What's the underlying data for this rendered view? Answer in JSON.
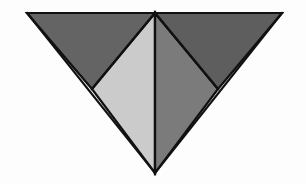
{
  "figure": {
    "name": "subdivided-inverted-triangle",
    "canvas": {
      "width": 306,
      "height": 184,
      "background_color": "#fdfdfd"
    },
    "stroke": {
      "color": "#111111",
      "width": 2.2
    },
    "vertices": {
      "top_left": [
        27,
        13
      ],
      "top_right": [
        282,
        13
      ],
      "top_center": [
        155,
        13
      ],
      "bottom_center": [
        155,
        173
      ],
      "left_mid": [
        92,
        89
      ],
      "right_mid": [
        218,
        89
      ]
    },
    "regions": [
      {
        "id": "left-outer-triangle",
        "label": "Left outer triangle",
        "fill_color": "#646464",
        "points": "27,13 155,13 92,89"
      },
      {
        "id": "left-center-triangle",
        "label": "Left center triangle",
        "fill_color": "#cbcbcb",
        "points": "92,89 155,13 155,173"
      },
      {
        "id": "right-center-triangle",
        "label": "Right center triangle",
        "fill_color": "#7b7b7b",
        "points": "155,13 218,89 155,173"
      },
      {
        "id": "right-outer-triangle",
        "label": "Right outer triangle",
        "fill_color": "#5e5e5e",
        "points": "155,13 282,13 218,89"
      }
    ],
    "edges": [
      {
        "id": "top-edge",
        "label": "Top horizontal edge",
        "from": [
          27,
          13
        ],
        "to": [
          282,
          13
        ]
      },
      {
        "id": "left-edge",
        "label": "Left slanted edge",
        "from": [
          27,
          13
        ],
        "to": [
          155,
          173
        ]
      },
      {
        "id": "right-edge",
        "label": "Right slanted edge",
        "from": [
          282,
          13
        ],
        "to": [
          155,
          173
        ]
      },
      {
        "id": "center-vertical-edge",
        "label": "Central vertical edge",
        "from": [
          155,
          13
        ],
        "to": [
          155,
          173
        ]
      },
      {
        "id": "left-diagonal-edge",
        "label": "Left inner diagonal edge",
        "from": [
          155,
          13
        ],
        "to": [
          92,
          89
        ]
      },
      {
        "id": "right-diagonal-edge",
        "label": "Right inner diagonal edge",
        "from": [
          155,
          13
        ],
        "to": [
          218,
          89
        ]
      }
    ]
  }
}
